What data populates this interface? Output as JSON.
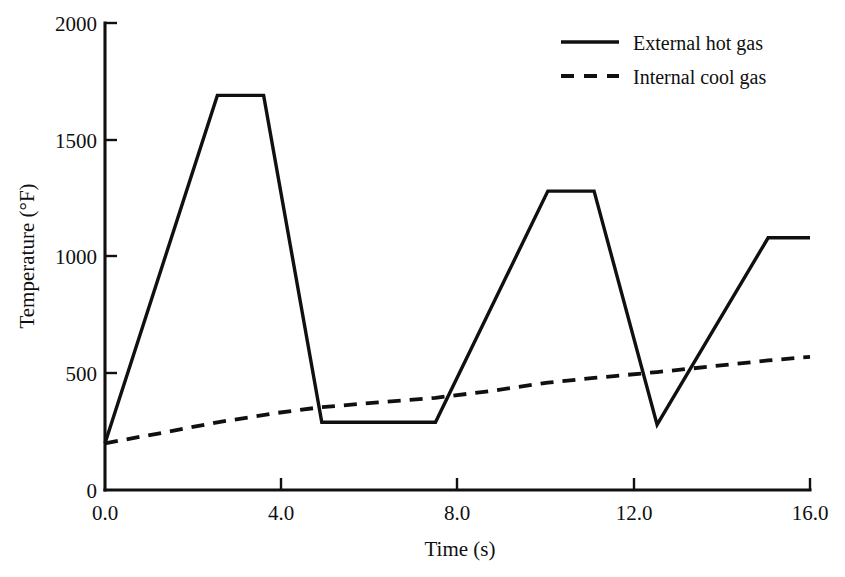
{
  "chart_data": {
    "type": "line",
    "title": "",
    "xlabel": "Time (s)",
    "ylabel": "Temperature (°F)",
    "xlim": [
      0.0,
      16.0
    ],
    "ylim": [
      0,
      2000
    ],
    "xticks": [
      0.0,
      4.0,
      8.0,
      12.0,
      16.0
    ],
    "xtick_labels": [
      "0.0",
      "4.0",
      "8.0",
      "12.0",
      "16.0"
    ],
    "yticks": [
      0,
      500,
      1000,
      1500,
      2000
    ],
    "ytick_labels": [
      "0",
      "500",
      "1000",
      "1500",
      "2000"
    ],
    "grid": false,
    "legend_position": "top-right",
    "series": [
      {
        "name": "External hot gas",
        "style": "solid",
        "color": "#101010",
        "points": [
          [
            0.0,
            200
          ],
          [
            2.55,
            1690
          ],
          [
            3.6,
            1690
          ],
          [
            4.92,
            290
          ],
          [
            7.5,
            290
          ],
          [
            10.05,
            1280
          ],
          [
            11.1,
            1280
          ],
          [
            12.53,
            280
          ],
          [
            15.05,
            1080
          ],
          [
            16.0,
            1080
          ]
        ]
      },
      {
        "name": "Internal cool gas",
        "style": "dashed",
        "color": "#101010",
        "points": [
          [
            0.0,
            200
          ],
          [
            1.3,
            245
          ],
          [
            2.55,
            290
          ],
          [
            3.9,
            330
          ],
          [
            4.92,
            355
          ],
          [
            6.2,
            375
          ],
          [
            7.5,
            395
          ],
          [
            8.8,
            425
          ],
          [
            10.05,
            460
          ],
          [
            11.1,
            480
          ],
          [
            12.53,
            505
          ],
          [
            13.8,
            530
          ],
          [
            15.05,
            555
          ],
          [
            16.0,
            570
          ]
        ]
      }
    ]
  },
  "legend": {
    "entries": [
      {
        "label": "External hot gas",
        "style": "solid"
      },
      {
        "label": "Internal cool gas",
        "style": "dashed"
      }
    ]
  },
  "axes": {
    "x_title": "Time (s)",
    "y_title": "Temperature (°F)",
    "x_tick_labels": [
      "0.0",
      "4.0",
      "8.0",
      "12.0",
      "16.0"
    ],
    "y_tick_labels": [
      "0",
      "500",
      "1000",
      "1500",
      "2000"
    ]
  }
}
